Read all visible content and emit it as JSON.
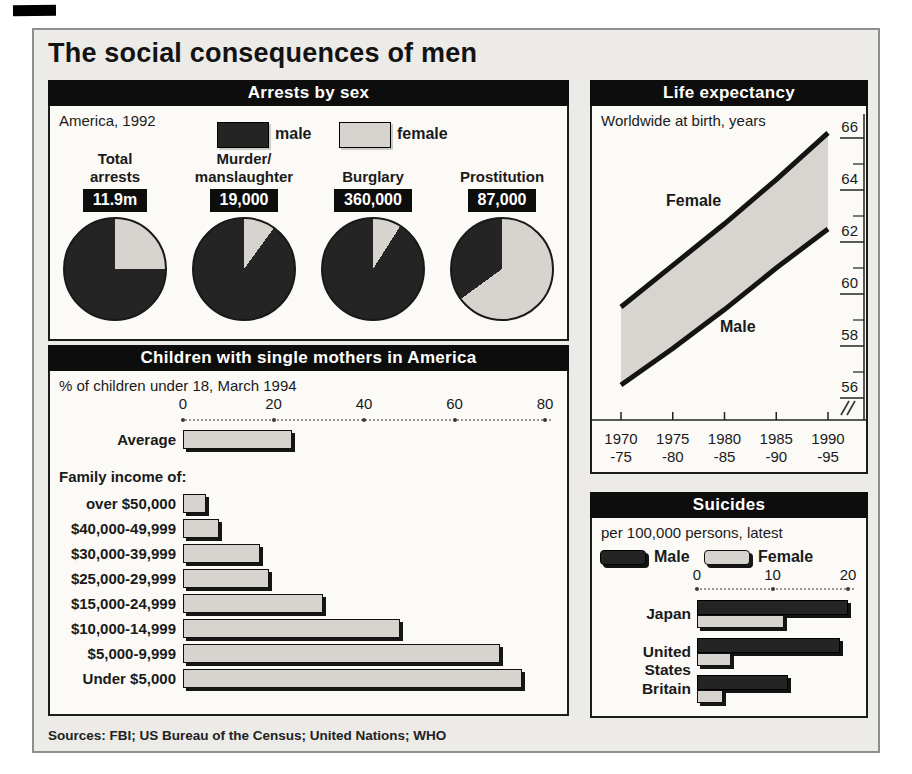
{
  "page": {
    "title": "The social consequences of men",
    "sources": "Sources: FBI; US Bureau of the Census; United Nations; WHO"
  },
  "colors": {
    "male": "#242424",
    "female": "#d7d4cf",
    "band": "#d8d5d0",
    "line": "#141414",
    "panel_bg": "#ecebe7",
    "box_bg": "#fbfaf7",
    "header_bg": "#0d0d0d"
  },
  "panels": {
    "arrests": {
      "header": "Arrests by sex",
      "subtitle": "America, 1992",
      "legend_male": "male",
      "legend_female": "female"
    },
    "life": {
      "header": "Life expectancy",
      "subtitle": "Worldwide at birth, years"
    },
    "children": {
      "header": "Children with single mothers in America",
      "subtitle": "% of children under 18, March 1994",
      "group_label": "Family income of:"
    },
    "suicides": {
      "header": "Suicides",
      "subtitle": "per 100,000 persons, latest",
      "legend_male": "Male",
      "legend_female": "Female"
    }
  },
  "chart_data": [
    {
      "id": "arrests",
      "type": "pie",
      "title": "Arrests by sex",
      "subtitle": "America, 1992",
      "legend": [
        "male",
        "female"
      ],
      "pies": [
        {
          "label": "Total\narrests",
          "value_label": "11.9m",
          "female_pct": 25,
          "male_pct": 75
        },
        {
          "label": "Murder/\nmanslaughter",
          "value_label": "19,000",
          "female_pct": 10,
          "male_pct": 90
        },
        {
          "label": "Burglary",
          "value_label": "360,000",
          "female_pct": 9,
          "male_pct": 91
        },
        {
          "label": "Prostitution",
          "value_label": "87,000",
          "female_pct": 65,
          "male_pct": 35
        }
      ]
    },
    {
      "id": "life",
      "type": "area",
      "title": "Life expectancy",
      "subtitle": "Worldwide at birth, years",
      "x_labels": [
        [
          "1970",
          "-75"
        ],
        [
          "1975",
          "-80"
        ],
        [
          "1980",
          "-85"
        ],
        [
          "1985",
          "-90"
        ],
        [
          "1990",
          "-95"
        ]
      ],
      "series": [
        {
          "name": "Female",
          "values": [
            59.5,
            61.1,
            62.7,
            64.4,
            66.2
          ]
        },
        {
          "name": "Male",
          "values": [
            56.5,
            57.9,
            59.4,
            61.0,
            62.5
          ]
        }
      ],
      "y_ticks": [
        66,
        64,
        62,
        60,
        58,
        56
      ],
      "ylim": [
        55.2,
        66.5
      ],
      "axis_break": true,
      "legend_position": "on-chart"
    },
    {
      "id": "children",
      "type": "bar",
      "title": "Children with single mothers in America",
      "subtitle": "% of children under 18, March 1994",
      "x_ticks": [
        0,
        20,
        40,
        60,
        80
      ],
      "xlim": [
        0,
        80
      ],
      "average_row": {
        "label": "Average",
        "value": 24
      },
      "group_label": "Family income of:",
      "income_rows": [
        {
          "label": "over $50,000",
          "value": 5
        },
        {
          "label": "$40,000-49,999",
          "value": 8
        },
        {
          "label": "$30,000-39,999",
          "value": 17
        },
        {
          "label": "$25,000-29,999",
          "value": 19
        },
        {
          "label": "$15,000-24,999",
          "value": 31
        },
        {
          "label": "$10,000-14,999",
          "value": 48
        },
        {
          "label": "$5,000-9,999",
          "value": 70
        },
        {
          "label": "Under $5,000",
          "value": 75
        }
      ]
    },
    {
      "id": "suicides",
      "type": "bar",
      "title": "Suicides",
      "subtitle": "per 100,000 persons, latest",
      "x_ticks": [
        0,
        10,
        20
      ],
      "xlim": [
        0,
        20
      ],
      "categories": [
        "Japan",
        "United States",
        "Britain"
      ],
      "series": [
        {
          "name": "Male",
          "values": [
            20,
            19,
            12
          ]
        },
        {
          "name": "Female",
          "values": [
            11.5,
            4.5,
            3.5
          ]
        }
      ]
    }
  ]
}
